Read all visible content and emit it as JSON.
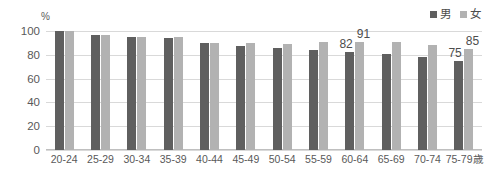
{
  "chart_data": {
    "type": "bar",
    "title": "",
    "xlabel": "",
    "ylabel": "",
    "unit_label": "%",
    "ylim": [
      0,
      100
    ],
    "yticks": [
      100,
      80,
      60,
      40,
      20,
      0
    ],
    "grid": true,
    "legend_position": "top-right",
    "categories": [
      "20-24",
      "25-29",
      "30-34",
      "35-39",
      "40-44",
      "45-49",
      "50-54",
      "55-59",
      "60-64",
      "65-69",
      "70-74",
      "75-79歳"
    ],
    "series": [
      {
        "name": "男",
        "color": "#5f5f5f",
        "values": [
          100,
          97,
          95,
          94,
          90,
          87,
          86,
          84,
          82,
          81,
          78,
          75
        ],
        "labels": [
          "",
          "",
          "",
          "",
          "",
          "",
          "",
          "",
          "82",
          "",
          "",
          "75"
        ]
      },
      {
        "name": "女",
        "color": "#b2b2b2",
        "values": [
          100,
          97,
          95,
          95,
          90,
          90,
          89,
          91,
          91,
          91,
          88,
          85
        ],
        "labels": [
          "",
          "",
          "",
          "",
          "",
          "",
          "",
          "",
          "91",
          "",
          "",
          "85"
        ]
      }
    ]
  }
}
